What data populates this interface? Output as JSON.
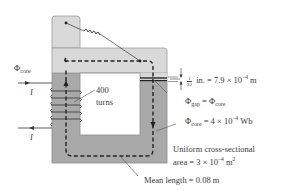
{
  "diagram": {
    "type": "magnetic-circuit",
    "labels": {
      "phi_core_left": {
        "symbol": "Φ",
        "sub": "core"
      },
      "current_in": "I",
      "current_out": "I",
      "turns_value": "400",
      "turns_unit": "turns",
      "gap_frac_num": "1",
      "gap_frac_den": "32",
      "gap_rest": " in. = 7.9 × 10",
      "gap_exp": "−4",
      "gap_unit": " m",
      "phi_gap_symbol": "Φ",
      "phi_gap_sub": "gap",
      "phi_gap_eq": " = Φ",
      "phi_gap_eq_sub": "core",
      "phi_core_value_symbol": "Φ",
      "phi_core_value_sub": "core",
      "phi_core_value_rest": " = 4 × 10",
      "phi_core_value_exp": "−4",
      "phi_core_value_unit": " Wb",
      "area_line1": "Uniform cross-sectional",
      "area_line2_pre": "area = 3 × 10",
      "area_line2_exp": "−4",
      "area_line2_unit": " m",
      "area_line2_unit_exp": "2",
      "mean_length": "Mean length = 0.08 m"
    },
    "colors": {
      "core_upper": "#d9d9d9",
      "core_lower": "#a9a9a9",
      "outline": "#8a8a8a",
      "flux_path": "#222222",
      "text": "#3a3a3a"
    }
  }
}
